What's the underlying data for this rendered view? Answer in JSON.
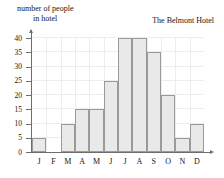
{
  "chart_data": {
    "type": "bar",
    "title": "The Belmont Hotel",
    "ylabel_line1": "number of people",
    "ylabel_line2": "in hotel",
    "xlabel": "",
    "categories": [
      "J",
      "F",
      "M",
      "A",
      "M",
      "J",
      "J",
      "A",
      "S",
      "O",
      "N",
      "D"
    ],
    "values": [
      5,
      0,
      10,
      15,
      15,
      25,
      40,
      40,
      35,
      20,
      5,
      10
    ],
    "yticks": [
      0,
      5,
      10,
      15,
      20,
      25,
      30,
      35,
      40
    ],
    "ylim": [
      0,
      40
    ],
    "grid": true,
    "legend": "none",
    "bar_fill": "#e9e9e9",
    "bar_border": "#9a9a9a",
    "axis_color": "#6d6d6d"
  }
}
